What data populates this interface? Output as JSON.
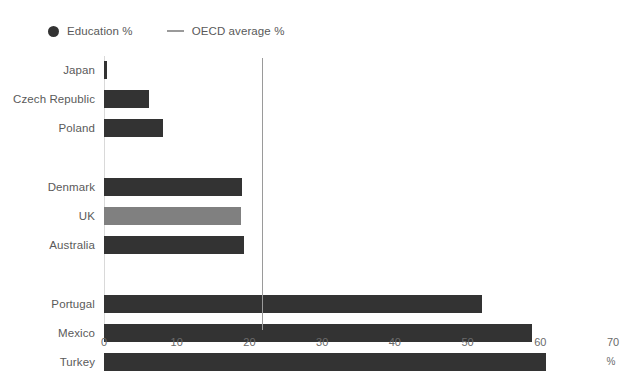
{
  "legend": {
    "items": [
      {
        "label": "Education %",
        "marker": "dot",
        "color": "#333333",
        "name": "legend-education"
      },
      {
        "label": "OECD average %",
        "marker": "line",
        "color": "#9a9a9a",
        "name": "legend-oecd-average"
      }
    ]
  },
  "axis": {
    "unit_label": "%",
    "ticks": [
      "0",
      "10",
      "20",
      "30",
      "40",
      "50",
      "60",
      "70"
    ]
  },
  "chart_data": {
    "type": "bar",
    "orientation": "horizontal",
    "title": "",
    "xlabel": "%",
    "ylabel": "",
    "xlim": [
      0,
      70
    ],
    "xticks": [
      0,
      10,
      20,
      30,
      40,
      50,
      60,
      70
    ],
    "grid": false,
    "legend_position": "top-left",
    "categories": [
      "Japan",
      "Czech Republic",
      "Poland",
      "Denmark",
      "UK",
      "Australia",
      "Portugal",
      "Mexico",
      "Turkey"
    ],
    "series": [
      {
        "name": "Education %",
        "values": [
          0.4,
          6.2,
          8.1,
          19.0,
          18.9,
          19.2,
          52.0,
          58.9,
          60.8
        ]
      }
    ],
    "groups": [
      {
        "name": "low",
        "categories": [
          "Japan",
          "Czech Republic",
          "Poland"
        ]
      },
      {
        "name": "mid",
        "categories": [
          "Denmark",
          "UK",
          "Australia"
        ]
      },
      {
        "name": "high",
        "categories": [
          "Portugal",
          "Mexico",
          "Turkey"
        ]
      }
    ],
    "highlighted_category": "UK",
    "reference_line": {
      "name": "OECD average %",
      "value": 21.7,
      "color": "#9a9a9a"
    },
    "bar_color": "#333333",
    "highlight_color": "#808080"
  }
}
